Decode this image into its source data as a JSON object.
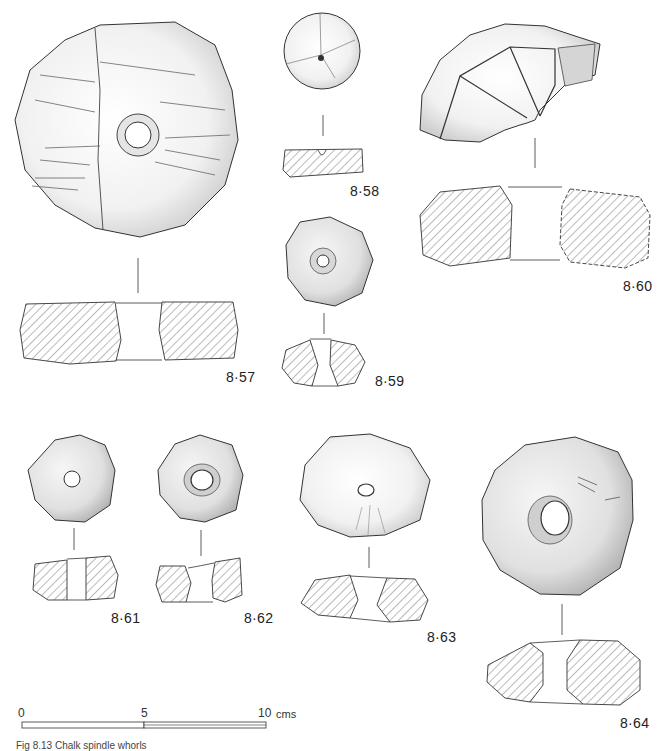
{
  "figure": {
    "caption": "Fig 8.13  Chalk spindle whorls",
    "objects": [
      {
        "id": "8·57",
        "label": "8·57"
      },
      {
        "id": "8·58",
        "label": "8·58"
      },
      {
        "id": "8·59",
        "label": "8·59"
      },
      {
        "id": "8·60",
        "label": "8·60"
      },
      {
        "id": "8·61",
        "label": "8·61"
      },
      {
        "id": "8·62",
        "label": "8·62"
      },
      {
        "id": "8·63",
        "label": "8·63"
      },
      {
        "id": "8·64",
        "label": "8·64"
      }
    ],
    "scale_bar": {
      "ticks": [
        "0",
        "5",
        "10"
      ],
      "unit": "cms"
    }
  },
  "colors": {
    "ink": "#333333",
    "hatch": "#555555",
    "background": "#ffffff"
  }
}
